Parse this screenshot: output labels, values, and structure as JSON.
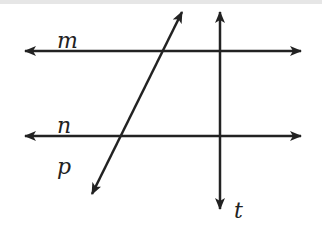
{
  "diagram": {
    "colors": {
      "line": "#222222",
      "background": "#ffffff"
    },
    "lines": [
      {
        "name": "m",
        "label": "m",
        "x1": 25,
        "y1": 51,
        "x2": 301,
        "y2": 51
      },
      {
        "name": "n",
        "label": "n",
        "x1": 25,
        "y1": 136,
        "x2": 301,
        "y2": 136
      },
      {
        "name": "t",
        "label": "t",
        "x1": 220,
        "y1": 12,
        "x2": 220,
        "y2": 209
      },
      {
        "name": "p",
        "label": "p",
        "x1": 182,
        "y1": 12,
        "x2": 92,
        "y2": 194
      }
    ],
    "labels": {
      "m": "m",
      "n": "n",
      "p": "p",
      "t": "t"
    }
  }
}
